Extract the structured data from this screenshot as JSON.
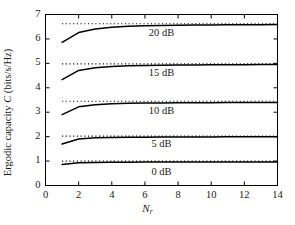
{
  "chart_data": {
    "type": "line",
    "title": "",
    "xlabel": "N_r",
    "xlabel_main": "N",
    "xlabel_sub": "r",
    "ylabel": "Ergodic capacity C (bits/s/Hz)",
    "ylabel_prefix": "Ergodic capacity ",
    "ylabel_symbol": "C",
    "ylabel_suffix": " (bits/s/Hz)",
    "xlim": [
      0,
      14
    ],
    "ylim": [
      0,
      7
    ],
    "xticks": [
      0,
      2,
      4,
      6,
      8,
      10,
      12,
      14
    ],
    "xtick_labels": [
      "0",
      "2",
      "4",
      "6",
      "8",
      "10",
      "12",
      "14"
    ],
    "yticks": [
      0,
      1,
      2,
      3,
      4,
      5,
      6,
      7
    ],
    "ytick_labels": [
      "0",
      "1",
      "2",
      "3",
      "4",
      "5",
      "6",
      "7"
    ],
    "grid": false,
    "legend_position": "inline-annotations",
    "line_color": "#000000",
    "dotted_color": "#000000",
    "axes_color": "#000000",
    "background_color": "#ffffff",
    "x": [
      1,
      2,
      3,
      4,
      5,
      6,
      7,
      8,
      9,
      10,
      11,
      12,
      13,
      14
    ],
    "series": [
      {
        "name": "20 dB",
        "label": "20 dB",
        "style": "solid",
        "label_x": 7.0,
        "label_y": 6.22,
        "values": [
          5.86,
          6.26,
          6.41,
          6.48,
          6.52,
          6.54,
          6.55,
          6.56,
          6.57,
          6.57,
          6.58,
          6.58,
          6.58,
          6.59
        ]
      },
      {
        "name": "20 dB asymptote",
        "label": "",
        "style": "dotted",
        "values": [
          6.62,
          6.62,
          6.62,
          6.62,
          6.62,
          6.62,
          6.62,
          6.62,
          6.62,
          6.62,
          6.62,
          6.62,
          6.62,
          6.62
        ]
      },
      {
        "name": "15 dB",
        "label": "15 dB",
        "style": "solid",
        "label_x": 7.0,
        "label_y": 4.55,
        "values": [
          4.33,
          4.71,
          4.82,
          4.87,
          4.9,
          4.91,
          4.92,
          4.93,
          4.93,
          4.94,
          4.94,
          4.94,
          4.95,
          4.95
        ]
      },
      {
        "name": "15 dB asymptote",
        "label": "",
        "style": "dotted",
        "values": [
          4.98,
          4.98,
          4.98,
          4.98,
          4.98,
          4.98,
          4.98,
          4.98,
          4.98,
          4.98,
          4.98,
          4.98,
          4.98,
          4.98
        ]
      },
      {
        "name": "10 dB",
        "label": "10 dB",
        "style": "solid",
        "label_x": 7.0,
        "label_y": 3.02,
        "values": [
          2.9,
          3.22,
          3.31,
          3.35,
          3.37,
          3.38,
          3.38,
          3.39,
          3.39,
          3.39,
          3.4,
          3.4,
          3.4,
          3.4
        ]
      },
      {
        "name": "10 dB asymptote",
        "label": "",
        "style": "dotted",
        "values": [
          3.45,
          3.45,
          3.45,
          3.45,
          3.45,
          3.45,
          3.45,
          3.45,
          3.45,
          3.45,
          3.45,
          3.45,
          3.45,
          3.45
        ]
      },
      {
        "name": "5 dB",
        "label": "5 dB",
        "style": "solid",
        "label_x": 7.0,
        "label_y": 1.66,
        "values": [
          1.7,
          1.9,
          1.95,
          1.97,
          1.98,
          1.98,
          1.99,
          1.99,
          1.99,
          1.99,
          2.0,
          2.0,
          2.0,
          2.0
        ]
      },
      {
        "name": "5 dB asymptote",
        "label": "",
        "style": "dotted",
        "values": [
          2.02,
          2.02,
          2.02,
          2.02,
          2.02,
          2.02,
          2.02,
          2.02,
          2.02,
          2.02,
          2.02,
          2.02,
          2.02,
          2.02
        ]
      },
      {
        "name": "0 dB",
        "label": "0 dB",
        "style": "solid",
        "label_x": 7.0,
        "label_y": 0.52,
        "values": [
          0.86,
          0.93,
          0.945,
          0.95,
          0.955,
          0.958,
          0.96,
          0.961,
          0.962,
          0.963,
          0.964,
          0.965,
          0.965,
          0.966
        ]
      },
      {
        "name": "0 dB asymptote",
        "label": "",
        "style": "dotted",
        "values": [
          1.0,
          1.0,
          1.0,
          1.0,
          1.0,
          1.0,
          1.0,
          1.0,
          1.0,
          1.0,
          1.0,
          1.0,
          1.0,
          1.0
        ]
      }
    ]
  }
}
